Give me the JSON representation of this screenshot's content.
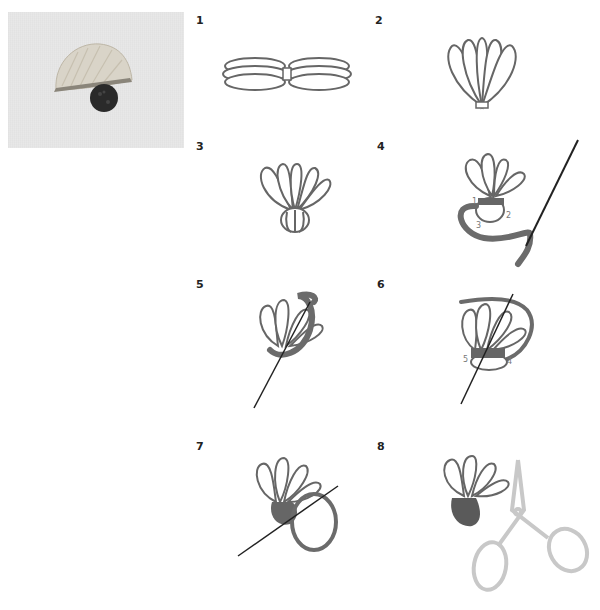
{
  "figure": {
    "photo": {
      "alt": "finished tufted stitch on linen"
    },
    "steps": [
      {
        "num": "1"
      },
      {
        "num": "2"
      },
      {
        "num": "3"
      },
      {
        "num": "4",
        "labels": [
          "1",
          "2",
          "3"
        ]
      },
      {
        "num": "5"
      },
      {
        "num": "6",
        "labels": [
          "5",
          "4"
        ]
      },
      {
        "num": "7"
      },
      {
        "num": "8"
      }
    ]
  },
  "colors": {
    "thread": "#6b6b6b",
    "outline": "#555555",
    "scissors": "#c8c8c8",
    "photo_bg": "#e8e8e8",
    "tuft": "#d8d2c4",
    "knob": "#2a2a2a"
  }
}
